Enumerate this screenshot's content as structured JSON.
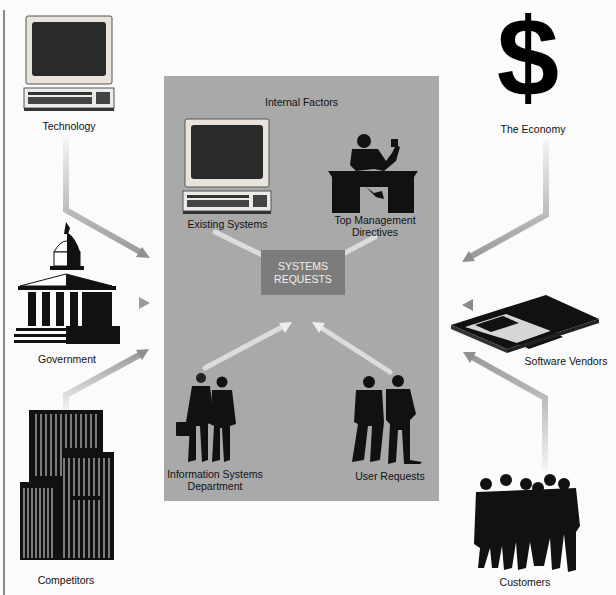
{
  "diagram": {
    "title": "Internal Factors",
    "center": {
      "line1": "SYSTEMS",
      "line2": "REQUESTS"
    },
    "internal_factors": [
      {
        "label": "Existing Systems",
        "icon": "computer-icon"
      },
      {
        "label_line1": "Top Management",
        "label_line2": "Directives",
        "icon": "executive-desk-icon"
      },
      {
        "label_line1": "Information Systems",
        "label_line2": "Department",
        "icon": "people-pair-icon"
      },
      {
        "label": "User Requests",
        "icon": "users-icon"
      }
    ],
    "external_factors": [
      {
        "label": "Technology",
        "icon": "computer-icon"
      },
      {
        "label": "Government",
        "icon": "capitol-building-icon"
      },
      {
        "label": "Competitors",
        "icon": "skyscrapers-icon"
      },
      {
        "label": "The Economy",
        "icon": "dollar-sign-icon"
      },
      {
        "label": "Software Vendors",
        "icon": "floppy-disk-icon"
      },
      {
        "label": "Customers",
        "icon": "customers-group-icon"
      }
    ],
    "colors": {
      "panel": "#a9a9a9",
      "center_box": "#7c7c7c",
      "center_text": "#f0f0f0",
      "arrow_outer": "#8f8f8f",
      "arrow_inner": "#e4e4e4",
      "background": "#fbfbfb"
    },
    "dollar_glyph": "$"
  }
}
